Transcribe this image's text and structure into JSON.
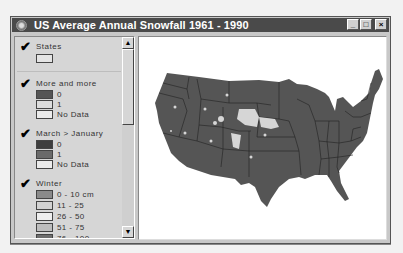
{
  "window": {
    "title": "US Average Annual Snowfall 1961 - 1990",
    "controls": {
      "minimize": "_",
      "maximize": "□",
      "close": "×"
    }
  },
  "colors": {
    "titlebar": "#4a4a4a",
    "map_land": "#555555",
    "map_snow": "#d8d8d8",
    "map_bg": "#ffffff",
    "panel": "#d6d6d6"
  },
  "legend": {
    "layers": [
      {
        "name": "States",
        "checked": true,
        "entries": [
          {
            "label": "",
            "color": "#e4e4e4"
          }
        ]
      },
      {
        "name": "More and more",
        "checked": true,
        "entries": [
          {
            "label": "0",
            "color": "#555555"
          },
          {
            "label": "1",
            "color": "#dcdcdc"
          },
          {
            "label": "No Data",
            "color": "#ebebeb"
          }
        ]
      },
      {
        "name": "March > January",
        "checked": true,
        "entries": [
          {
            "label": "0",
            "color": "#3e3e3e"
          },
          {
            "label": "1",
            "color": "#6a6a6a"
          },
          {
            "label": "No Data",
            "color": "#ebebeb"
          }
        ]
      },
      {
        "name": "Winter",
        "checked": true,
        "entries": [
          {
            "label": "0 - 10 cm",
            "color": "#8a8a8a"
          },
          {
            "label": "11 - 25",
            "color": "#d2d2d2"
          },
          {
            "label": "26 - 50",
            "color": "#eeeeee"
          },
          {
            "label": "51 - 75",
            "color": "#bdbdbd"
          },
          {
            "label": "76 - 100",
            "color": "#6e6e6e"
          }
        ]
      }
    ],
    "check_glyph": "✔",
    "scroll_up": "▲",
    "scroll_down": "▼"
  },
  "map": {
    "subject": "Contiguous United States with state boundaries",
    "highlighted_regions": [
      "South Dakota",
      "Wyoming",
      "Colorado",
      "Nebraska",
      "Utah",
      "Nevada",
      "Idaho",
      "Montana"
    ]
  }
}
